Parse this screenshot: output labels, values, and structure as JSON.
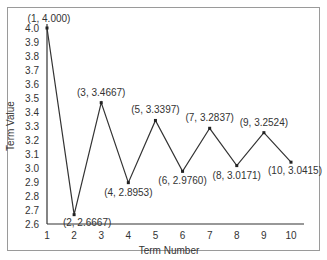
{
  "chart_data": {
    "type": "line",
    "title": "",
    "xlabel": "Term Number",
    "ylabel": "Term Value",
    "x": [
      1,
      2,
      3,
      4,
      5,
      6,
      7,
      8,
      9,
      10
    ],
    "values": [
      4.0,
      2.6667,
      3.4667,
      2.8953,
      3.3397,
      2.976,
      3.2837,
      3.0171,
      3.2524,
      3.0415
    ],
    "point_labels": [
      "(1, 4.000)",
      "(2, 2.6667)",
      "(3, 3.4667)",
      "(4, 2.8953)",
      "(5, 3.3397)",
      "(6, 2.9760)",
      "(7, 3.2837)",
      "(8, 3.0171)",
      "(9, 3.2524)",
      "(10, 3.0415)"
    ],
    "xticks": [
      "1",
      "2",
      "3",
      "4",
      "5",
      "6",
      "7",
      "8",
      "9",
      "10"
    ],
    "yticks": [
      "2.6",
      "2.7",
      "2.8",
      "2.9",
      "3.0",
      "3.1",
      "3.2",
      "3.3",
      "3.4",
      "3.5",
      "3.6",
      "3.7",
      "3.8",
      "3.9",
      "4.0"
    ],
    "xlim": [
      1,
      10
    ],
    "ylim": [
      2.6,
      4.0
    ],
    "grid": false,
    "legend": null
  }
}
